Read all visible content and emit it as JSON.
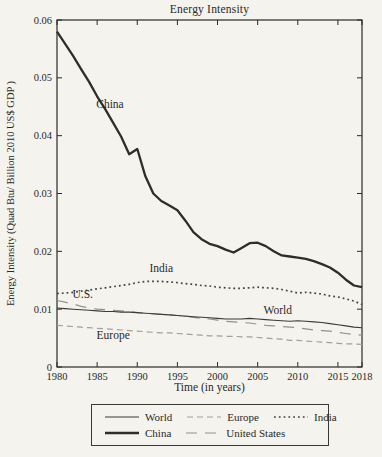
{
  "figure": {
    "title": "Energy Intensity"
  },
  "chart_data": {
    "type": "line",
    "title": "Energy Intensity",
    "xlabel": "Time (in years)",
    "ylabel": "Energy Intensity (Quad Btu/ Billion 2010 US$ GDP )",
    "xlim": [
      1980,
      2018
    ],
    "ylim": [
      0,
      0.06
    ],
    "x_ticks": [
      1980,
      1985,
      1990,
      1995,
      2000,
      2005,
      2010,
      2015,
      2018
    ],
    "y_ticks": [
      0,
      0.01,
      0.02,
      0.03,
      0.04,
      0.05,
      0.06
    ],
    "y_tick_labels": [
      "0",
      "0.01",
      "0.02",
      "0.03",
      "0.04",
      "0.05",
      "0.06"
    ],
    "grid": false,
    "legend_position": "bottom",
    "axis_color": "#2b2a27",
    "x": [
      1980,
      1981,
      1982,
      1983,
      1984,
      1985,
      1986,
      1987,
      1988,
      1989,
      1990,
      1991,
      1992,
      1993,
      1994,
      1995,
      1996,
      1997,
      1998,
      1999,
      2000,
      2001,
      2002,
      2003,
      2004,
      2005,
      2006,
      2007,
      2008,
      2009,
      2010,
      2011,
      2012,
      2013,
      2014,
      2015,
      2016,
      2017,
      2018
    ],
    "series": [
      {
        "name": "Europe",
        "style": "dashed",
        "width": 1.2,
        "color": "#a3a099",
        "values": [
          0.0072,
          0.0071,
          0.007,
          0.0069,
          0.0068,
          0.0067,
          0.0066,
          0.0065,
          0.0064,
          0.0063,
          0.0062,
          0.0061,
          0.006,
          0.0059,
          0.0059,
          0.0058,
          0.0057,
          0.0056,
          0.0055,
          0.0054,
          0.0054,
          0.0053,
          0.0053,
          0.0052,
          0.0052,
          0.0051,
          0.005,
          0.0049,
          0.0048,
          0.0046,
          0.0046,
          0.0045,
          0.0044,
          0.0043,
          0.0042,
          0.0041,
          0.004,
          0.004,
          0.0039
        ]
      },
      {
        "name": "United States",
        "style": "longdash",
        "width": 1.2,
        "color": "#94918a",
        "values": [
          0.0115,
          0.0112,
          0.0109,
          0.0105,
          0.0102,
          0.01,
          0.0099,
          0.0098,
          0.0097,
          0.0096,
          0.0094,
          0.0093,
          0.0092,
          0.0091,
          0.009,
          0.0089,
          0.0088,
          0.0086,
          0.0084,
          0.0083,
          0.0081,
          0.0079,
          0.0078,
          0.0077,
          0.0076,
          0.0074,
          0.0072,
          0.0071,
          0.007,
          0.0069,
          0.0068,
          0.0066,
          0.0064,
          0.0063,
          0.0062,
          0.006,
          0.0058,
          0.0056,
          0.0055
        ]
      },
      {
        "name": "World",
        "style": "solid",
        "width": 1.1,
        "color": "#3c3b37",
        "values": [
          0.0102,
          0.0101,
          0.01,
          0.0099,
          0.0098,
          0.0097,
          0.0096,
          0.0096,
          0.0095,
          0.0095,
          0.0094,
          0.0093,
          0.0092,
          0.0091,
          0.009,
          0.0089,
          0.0088,
          0.0087,
          0.0086,
          0.0085,
          0.0084,
          0.0083,
          0.0083,
          0.0083,
          0.0084,
          0.0083,
          0.0082,
          0.0081,
          0.008,
          0.0079,
          0.008,
          0.0079,
          0.0078,
          0.0077,
          0.0075,
          0.0073,
          0.0071,
          0.0069,
          0.0068
        ]
      },
      {
        "name": "India",
        "style": "dotted",
        "width": 1.7,
        "color": "#45443f",
        "values": [
          0.0127,
          0.0128,
          0.0129,
          0.0131,
          0.0133,
          0.0135,
          0.0137,
          0.0139,
          0.0141,
          0.0143,
          0.0146,
          0.0148,
          0.0148,
          0.0148,
          0.0147,
          0.0146,
          0.0144,
          0.0143,
          0.0141,
          0.014,
          0.0138,
          0.0137,
          0.0136,
          0.0136,
          0.0137,
          0.0138,
          0.0137,
          0.0136,
          0.0134,
          0.0131,
          0.0128,
          0.0129,
          0.0128,
          0.0126,
          0.0123,
          0.0121,
          0.0118,
          0.0114,
          0.0108
        ]
      },
      {
        "name": "China",
        "style": "solid",
        "width": 2.3,
        "color": "#2e2d2a",
        "values": [
          0.058,
          0.0559,
          0.0538,
          0.0515,
          0.0493,
          0.0468,
          0.0446,
          0.0422,
          0.0398,
          0.0368,
          0.0377,
          0.033,
          0.03,
          0.0287,
          0.0279,
          0.0271,
          0.0253,
          0.0233,
          0.0221,
          0.0213,
          0.0209,
          0.0203,
          0.0198,
          0.0206,
          0.0214,
          0.0215,
          0.0209,
          0.02,
          0.0193,
          0.0191,
          0.0189,
          0.0187,
          0.0183,
          0.0178,
          0.0172,
          0.0163,
          0.0151,
          0.0141,
          0.0138
        ]
      }
    ],
    "annotations": [
      {
        "text": "China",
        "x": 1986.6,
        "y": 0.0455
      },
      {
        "text": "India",
        "x": 1993.0,
        "y": 0.0172
      },
      {
        "text": "U.S.",
        "x": 1983.2,
        "y": 0.0127
      },
      {
        "text": "Europe",
        "x": 1987.0,
        "y": 0.0055
      },
      {
        "text": "World",
        "x": 2007.5,
        "y": 0.0099
      }
    ],
    "legend": {
      "rows": [
        [
          "World",
          "Europe",
          "India"
        ],
        [
          "China",
          "United States"
        ]
      ]
    }
  }
}
